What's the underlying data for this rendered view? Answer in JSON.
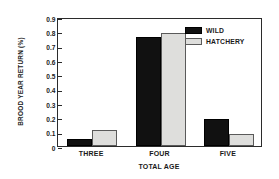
{
  "chart_data": {
    "type": "bar",
    "title": "",
    "xlabel": "TOTAL AGE",
    "ylabel": "BROOD YEAR RETURN (%)",
    "categories": [
      "THREE",
      "FOUR",
      "FIVE"
    ],
    "series": [
      {
        "name": "WILD",
        "color": "#111111",
        "values": [
          0.05,
          0.76,
          0.19
        ]
      },
      {
        "name": "HATCHERY",
        "color": "#dededc",
        "values": [
          0.115,
          0.785,
          0.085
        ]
      }
    ],
    "ylim": [
      0,
      0.9
    ],
    "ytick_labels": [
      "0.9",
      "0.8",
      "0.7",
      "0.6",
      "0.5",
      "0.4",
      "0.3",
      "0.2",
      "0.1",
      "0"
    ],
    "ytick_values": [
      0.9,
      0.8,
      0.7,
      0.6,
      0.5,
      0.4,
      0.3,
      0.2,
      0.1,
      0
    ],
    "grid": false,
    "legend_position": "top-right",
    "legend": [
      "WILD",
      "HATCHERY"
    ]
  }
}
